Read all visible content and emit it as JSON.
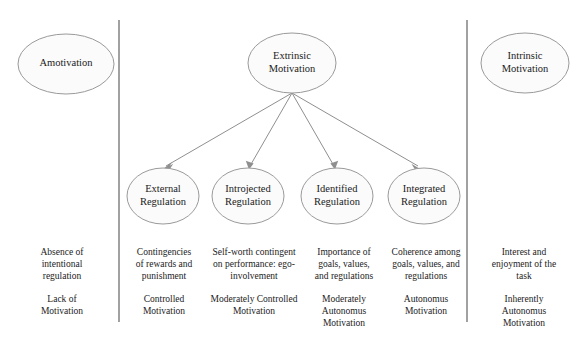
{
  "diagram": {
    "colors": {
      "background": "#ffffff",
      "node_fill": "#fbfbfb",
      "node_stroke": "#9a9a9a",
      "divider": "#8a8a8a",
      "arrow": "#8f8f8f",
      "text": "#1a1a1a"
    },
    "nodes": {
      "amotivation": {
        "label": "Amotivation",
        "cx": 66,
        "cy": 64,
        "rx": 48,
        "ry": 30
      },
      "extrinsic": {
        "label": "Extrinsic\nMotivation",
        "cx": 292,
        "cy": 63,
        "rx": 44,
        "ry": 30
      },
      "intrinsic": {
        "label": "Intrinsic\nMotivation",
        "cx": 525,
        "cy": 63,
        "rx": 44,
        "ry": 30
      },
      "external": {
        "label": "External\nRegulation",
        "cx": 163,
        "cy": 196,
        "rx": 36,
        "ry": 28
      },
      "introjected": {
        "label": "Introjected\nRegulation",
        "cx": 248,
        "cy": 196,
        "rx": 36,
        "ry": 28
      },
      "identified": {
        "label": "Identified\nRegulation",
        "cx": 337,
        "cy": 196,
        "rx": 36,
        "ry": 28
      },
      "integrated": {
        "label": "Integrated\nRegulation",
        "cx": 424,
        "cy": 196,
        "rx": 36,
        "ry": 28
      }
    },
    "dividers": [
      {
        "name": "left-divider",
        "x": 119,
        "y1": 20,
        "y2": 322
      },
      {
        "name": "right-divider",
        "x": 467,
        "y1": 20,
        "y2": 322
      }
    ],
    "arrows": {
      "origin": {
        "x": 292,
        "y": 93
      },
      "targets": [
        {
          "to": "external",
          "x": 163,
          "y": 170
        },
        {
          "to": "introjected",
          "x": 249,
          "y": 170
        },
        {
          "to": "identified",
          "x": 335,
          "y": 170
        },
        {
          "to": "integrated",
          "x": 421,
          "y": 170
        }
      ]
    },
    "description_row": [
      {
        "for": "amotivation",
        "text": "Absence of\nintentional\nregulation",
        "cx": 62,
        "left": 8,
        "width": 108
      },
      {
        "for": "external",
        "text": "Contingencies\nof rewards and\npunishment",
        "cx": 163,
        "left": 122,
        "width": 84
      },
      {
        "for": "introjected",
        "text": "Self-worth contingent\non performance: ego-\ninvolvement",
        "cx": 251,
        "left": 206,
        "width": 100
      },
      {
        "for": "identified",
        "text": "Importance of\ngoals, values,\nand regulations",
        "cx": 340,
        "left": 306,
        "width": 76
      },
      {
        "for": "integrated",
        "text": "Coherence among\ngoals, values, and\nregulations",
        "cx": 426,
        "left": 382,
        "width": 88
      },
      {
        "for": "intrinsic",
        "text": "Interest and\nenjoyment of the\ntask",
        "cx": 524,
        "left": 472,
        "width": 104
      }
    ],
    "summary_row": [
      {
        "for": "amotivation",
        "text": "Lack of\nMotivation",
        "left": 8,
        "width": 108
      },
      {
        "for": "external",
        "text": "Controlled\nMotivation",
        "left": 122,
        "width": 84
      },
      {
        "for": "introjected",
        "text": "Moderately Controlled\nMotivation",
        "left": 204,
        "width": 104
      },
      {
        "for": "identified",
        "text": "Moderately\nAutonomus\nMotivation",
        "left": 306,
        "width": 76
      },
      {
        "for": "integrated",
        "text": "Autonomus\nMotivation",
        "left": 382,
        "width": 88
      },
      {
        "for": "intrinsic",
        "text": "Inherently\nAutonomus\nMotivation",
        "left": 472,
        "width": 104
      }
    ]
  }
}
